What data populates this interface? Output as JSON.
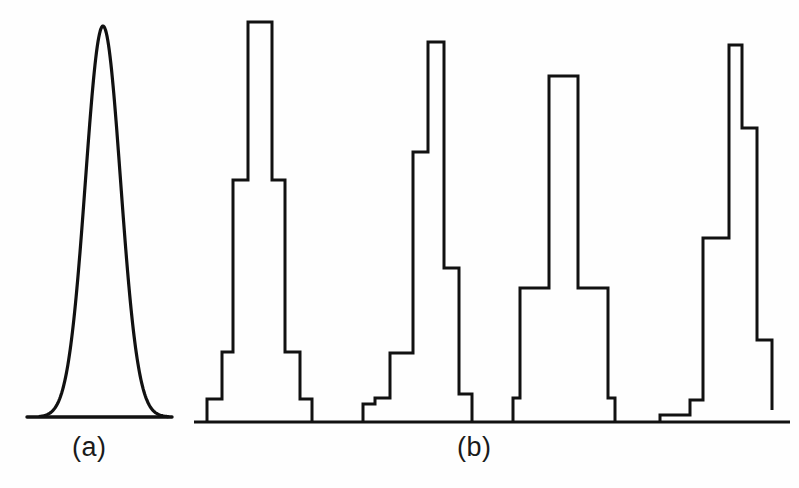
{
  "figure": {
    "background_color": "#fefefe",
    "stroke_color": "#111111",
    "width": 799,
    "height": 488,
    "panels": [
      {
        "id": "a",
        "label": "(a)",
        "label_x": 72,
        "label_y": 432
      },
      {
        "id": "b",
        "label": "(b)",
        "label_x": 457,
        "label_y": 432
      }
    ]
  },
  "chart_data": {
    "type": "line",
    "title": "",
    "subtitle": "",
    "xlabel": "",
    "ylabel": "",
    "grid": false,
    "legend": "none",
    "annotations": [
      "(a)",
      "(b)"
    ],
    "panels": [
      {
        "id": "a",
        "label": "(a)",
        "type": "line",
        "curve": "gaussian",
        "baseline_y": 417,
        "baseline_x_start": 27,
        "baseline_x_end": 172,
        "peak_x": 103,
        "peak_y": 26,
        "sigma_px": 17.5,
        "x_range": [
          40,
          168
        ],
        "samples": 170
      },
      {
        "id": "b",
        "label": "(b)",
        "type": "bar",
        "baseline_y": 422,
        "baseline_x_start": 194,
        "baseline_x_end": 790,
        "histograms": [
          {
            "name": "histogram-1",
            "symmetry": "symmetric",
            "edges": [
              207,
              222,
              233,
              248,
              272,
              285,
              300,
              312
            ],
            "tops": [
              399,
              352,
              180,
              22,
              180,
              352,
              399
            ]
          },
          {
            "name": "histogram-2",
            "symmetry": "right-skewed",
            "edges": [
              363,
              375,
              390,
              413,
              428,
              444,
              459,
              472
            ],
            "tops": [
              404,
              398,
              353,
              152,
              42,
              268,
              394
            ]
          },
          {
            "name": "histogram-3",
            "symmetry": "symmetric",
            "edges": [
              513,
              520,
              549,
              578,
              608,
              615
            ],
            "tops": [
              398,
              288,
              76,
              288,
              398
            ]
          },
          {
            "name": "histogram-4",
            "symmetry": "right-skewed",
            "edges": [
              660,
              690,
              703,
              729,
              742,
              757,
              772
            ],
            "tops": [
              415,
              400,
              238,
              45,
              128,
              340,
              410
            ]
          }
        ]
      }
    ]
  }
}
